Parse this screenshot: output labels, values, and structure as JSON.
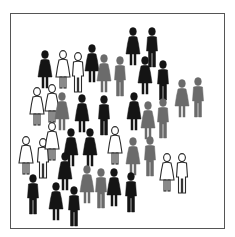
{
  "image": {
    "description": "Crowd of pictogram people icons inside a bordered frame",
    "colors": {
      "black": "#141414",
      "gray": "#6b6b6b",
      "white": "#ffffff",
      "outline": "#2a2a2a",
      "border": "#555555"
    },
    "figures": [
      {
        "x": 133,
        "y": 27,
        "color": "black",
        "type": "dress"
      },
      {
        "x": 152,
        "y": 27,
        "color": "black",
        "type": "pants"
      },
      {
        "x": 45,
        "y": 50,
        "color": "black",
        "type": "dress"
      },
      {
        "x": 63,
        "y": 50,
        "color": "white",
        "type": "dress"
      },
      {
        "x": 78,
        "y": 52,
        "color": "white",
        "type": "pants"
      },
      {
        "x": 92,
        "y": 44,
        "color": "black",
        "type": "dress"
      },
      {
        "x": 104,
        "y": 54,
        "color": "gray",
        "type": "dress"
      },
      {
        "x": 120,
        "y": 56,
        "color": "gray",
        "type": "pants"
      },
      {
        "x": 145,
        "y": 56,
        "color": "black",
        "type": "dress"
      },
      {
        "x": 163,
        "y": 60,
        "color": "black",
        "type": "pants"
      },
      {
        "x": 37,
        "y": 87,
        "color": "white",
        "type": "dress"
      },
      {
        "x": 52,
        "y": 84,
        "color": "white",
        "type": "dress"
      },
      {
        "x": 62,
        "y": 92,
        "color": "gray",
        "type": "dress"
      },
      {
        "x": 82,
        "y": 94,
        "color": "black",
        "type": "dress"
      },
      {
        "x": 104,
        "y": 95,
        "color": "black",
        "type": "pants"
      },
      {
        "x": 134,
        "y": 92,
        "color": "black",
        "type": "dress"
      },
      {
        "x": 148,
        "y": 101,
        "color": "gray",
        "type": "dress"
      },
      {
        "x": 163,
        "y": 98,
        "color": "gray",
        "type": "pants"
      },
      {
        "x": 182,
        "y": 79,
        "color": "gray",
        "type": "dress"
      },
      {
        "x": 198,
        "y": 77,
        "color": "gray",
        "type": "pants"
      },
      {
        "x": 26,
        "y": 136,
        "color": "white",
        "type": "dress"
      },
      {
        "x": 43,
        "y": 138,
        "color": "white",
        "type": "pants"
      },
      {
        "x": 52,
        "y": 122,
        "color": "white",
        "type": "dress"
      },
      {
        "x": 71,
        "y": 128,
        "color": "black",
        "type": "dress"
      },
      {
        "x": 90,
        "y": 128,
        "color": "black",
        "type": "dress"
      },
      {
        "x": 115,
        "y": 126,
        "color": "white",
        "type": "dress"
      },
      {
        "x": 133,
        "y": 137,
        "color": "gray",
        "type": "dress"
      },
      {
        "x": 150,
        "y": 136,
        "color": "gray",
        "type": "pants"
      },
      {
        "x": 65,
        "y": 152,
        "color": "black",
        "type": "dress"
      },
      {
        "x": 87,
        "y": 165,
        "color": "gray",
        "type": "dress"
      },
      {
        "x": 101,
        "y": 168,
        "color": "gray",
        "type": "pants"
      },
      {
        "x": 114,
        "y": 168,
        "color": "black",
        "type": "dress"
      },
      {
        "x": 131,
        "y": 172,
        "color": "black",
        "type": "pants"
      },
      {
        "x": 167,
        "y": 153,
        "color": "white",
        "type": "dress"
      },
      {
        "x": 182,
        "y": 153,
        "color": "white",
        "type": "pants"
      },
      {
        "x": 33,
        "y": 174,
        "color": "black",
        "type": "pants"
      },
      {
        "x": 56,
        "y": 182,
        "color": "black",
        "type": "dress"
      },
      {
        "x": 74,
        "y": 186,
        "color": "black",
        "type": "pants"
      }
    ]
  }
}
